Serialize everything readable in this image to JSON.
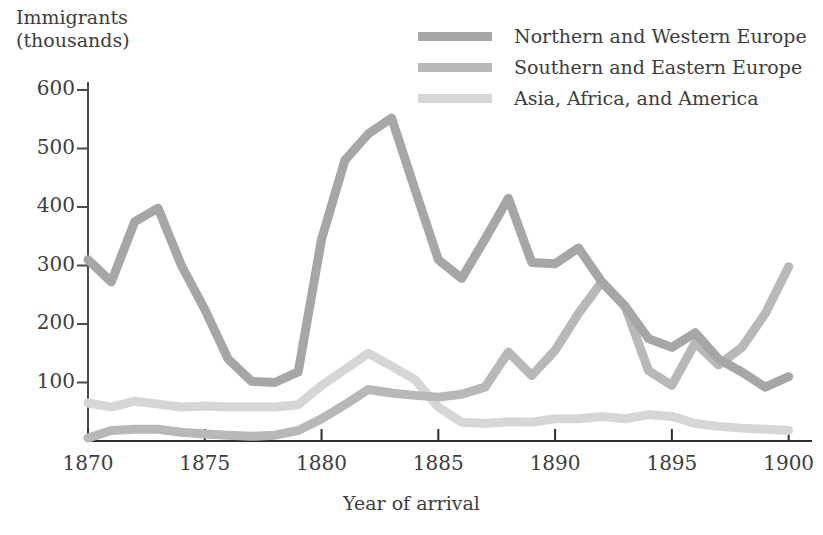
{
  "chart_data": {
    "type": "line",
    "title": "",
    "xlabel": "Year of arrival",
    "ylabel": "Immigrants\n(thousands)",
    "xlim": [
      1870,
      1901
    ],
    "ylim": [
      0,
      640
    ],
    "grid": false,
    "legend_position": "top-right",
    "xticks": [
      1870,
      1875,
      1880,
      1885,
      1890,
      1895,
      1900
    ],
    "xtick_labels": [
      "1870",
      "1875",
      "1880",
      "1885",
      "1890",
      "1895",
      "1900"
    ],
    "yticks": [
      100,
      200,
      300,
      400,
      500,
      600
    ],
    "ytick_labels": [
      "100",
      "200",
      "300",
      "400",
      "500",
      "600"
    ],
    "x": [
      1870,
      1871,
      1872,
      1873,
      1874,
      1875,
      1876,
      1877,
      1878,
      1879,
      1880,
      1881,
      1882,
      1883,
      1884,
      1885,
      1886,
      1887,
      1888,
      1889,
      1890,
      1891,
      1892,
      1893,
      1894,
      1895,
      1896,
      1897,
      1898,
      1899,
      1900
    ],
    "series": [
      {
        "name": "Northern and Western Europe",
        "color": "#a6a6a6",
        "values": [
          310,
          272,
          375,
          398,
          300,
          225,
          140,
          102,
          100,
          118,
          345,
          480,
          525,
          552,
          430,
          310,
          278,
          345,
          415,
          305,
          303,
          330,
          272,
          230,
          175,
          160,
          185,
          140,
          118,
          92,
          110
        ]
      },
      {
        "name": "Southern and Eastern Europe",
        "color": "#b8b8b8",
        "values": [
          5,
          18,
          20,
          20,
          15,
          12,
          10,
          8,
          10,
          18,
          38,
          62,
          88,
          82,
          78,
          75,
          80,
          92,
          152,
          112,
          155,
          218,
          272,
          230,
          120,
          95,
          168,
          130,
          160,
          218,
          298
        ]
      },
      {
        "name": "Asia, Africa, and America",
        "color": "#d6d6d6",
        "values": [
          65,
          58,
          68,
          63,
          58,
          60,
          58,
          58,
          58,
          62,
          95,
          122,
          150,
          128,
          105,
          58,
          32,
          30,
          33,
          32,
          38,
          38,
          42,
          38,
          45,
          42,
          30,
          25,
          22,
          20,
          18
        ]
      }
    ]
  },
  "legend": {
    "items": [
      {
        "label": "Northern and Western Europe",
        "color": "#a6a6a6"
      },
      {
        "label": "Southern and Eastern Europe",
        "color": "#b8b8b8"
      },
      {
        "label": "Asia, Africa, and America",
        "color": "#d6d6d6"
      }
    ]
  },
  "axes": {
    "y_axis_color": "#4a4a4a",
    "x_axis_color": "#2e2e2e"
  }
}
